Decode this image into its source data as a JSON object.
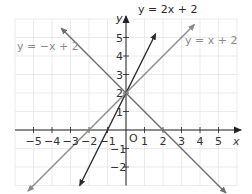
{
  "chart_data": {
    "type": "line",
    "title": "",
    "xlabel": "x",
    "ylabel": "y",
    "xlim": [
      -6,
      6
    ],
    "ylim": [
      -3,
      6
    ],
    "grid": true,
    "origin_label": "O",
    "x_ticks": [
      "-5",
      "-4",
      "-3",
      "-2",
      "-1",
      "1",
      "2",
      "3",
      "4",
      "5"
    ],
    "y_ticks": [
      "-2",
      "-1",
      "1",
      "2",
      "3",
      "4",
      "5"
    ],
    "series": [
      {
        "name": "y = 2x + 2",
        "label": "y = 2x + 2",
        "slope": 2,
        "intercept": 2,
        "color": "#2b2b2b",
        "x_range": [
          -2.5,
          1.6
        ]
      },
      {
        "name": "y = x + 2",
        "label": "y = x + 2",
        "slope": 1,
        "intercept": 2,
        "color": "#8a8a8a",
        "x_range": [
          -5.3,
          3.7
        ]
      },
      {
        "name": "y = -x + 2",
        "label": "y = −x + 2",
        "slope": -1,
        "intercept": 2,
        "color": "#6e6e6e",
        "x_range": [
          -3.5,
          5.4
        ]
      }
    ]
  },
  "labels": {
    "line1": "y = 2x + 2",
    "line2": "y = x + 2",
    "line3": "y = −x + 2",
    "x_axis": "x",
    "y_axis": "y",
    "origin": "O"
  }
}
